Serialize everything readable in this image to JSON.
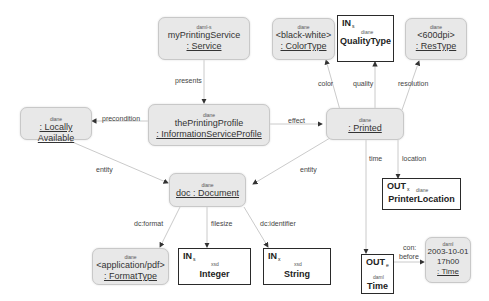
{
  "nodes": {
    "service": {
      "ns": "daml-s",
      "line1": "myPrintingService",
      "line2": ": Service"
    },
    "profile": {
      "ns": "diane",
      "line1": "thePrintingProfile",
      "line2": ": InformationServiceProfile"
    },
    "locally": {
      "ns": "diane",
      "line1": ": Locally Available"
    },
    "printed": {
      "ns": "diane",
      "line1": ": Printed"
    },
    "document": {
      "ns": "diane",
      "line1": "doc : Document"
    },
    "colortype": {
      "ns": "diane",
      "line1": "<black-white>",
      "line2": ": ColorType"
    },
    "qualitytype": {
      "io": "IN",
      "io_sub": "s",
      "ns": "diane",
      "name": "QualityType"
    },
    "restype": {
      "ns": "diane",
      "line1": "<600dpi>",
      "line2": ": ResType"
    },
    "printerlocation": {
      "io": "OUT",
      "io_sub": "x",
      "ns": "diane",
      "name": "PrinterLocation"
    },
    "formattype": {
      "ns": "diane",
      "line1": "<application/pdf>",
      "line2": ": FormatType"
    },
    "integer": {
      "io": "IN",
      "io_sub": "s",
      "ns": "xsd",
      "name": "Integer"
    },
    "string": {
      "io": "IN",
      "io_sub": "x",
      "ns": "xsd",
      "name": "String"
    },
    "time": {
      "io": "OUT",
      "io_sub": "e",
      "ns": "daml",
      "name": "Time"
    },
    "timeval": {
      "ns": "daml",
      "line1": "2003-10-01",
      "line2": "17h00",
      "line3": ": Time"
    }
  },
  "edges": {
    "presents": "presents",
    "precondition": "precondition",
    "effect": "effect",
    "entity_left": "entity",
    "entity_right": "entity",
    "color": "color",
    "quality": "quality",
    "resolution": "resolution",
    "time": "time",
    "location": "location",
    "dcformat": "dc:format",
    "filesize": "filesize",
    "dcidentifier": "dc:identifier",
    "con1": "con:",
    "con2": "before"
  },
  "colors": {
    "instance_fill": "#e8e8e8",
    "type_border": "#2a2a2a",
    "edge": "#bdbdbd",
    "arrow": "#333333"
  }
}
